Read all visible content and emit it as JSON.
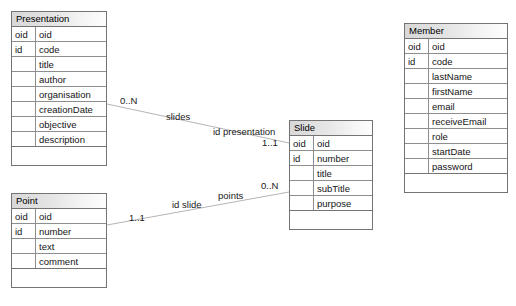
{
  "diagram": {
    "line_color": "#b4b4b4",
    "border_color": "#747474",
    "header_color": "#e0e0e0",
    "background": "#ffffff"
  },
  "classes": [
    {
      "id": "presentation",
      "name": "Presentation",
      "x": 11,
      "y": 11,
      "width": 96,
      "attributes": [
        {
          "key": "oid",
          "name": "oid"
        },
        {
          "key": "id",
          "name": "code"
        },
        {
          "key": "",
          "name": "title"
        },
        {
          "key": "",
          "name": "author"
        },
        {
          "key": "",
          "name": "organisation"
        },
        {
          "key": "",
          "name": "creationDate"
        },
        {
          "key": "",
          "name": "objective"
        },
        {
          "key": "",
          "name": "description"
        }
      ]
    },
    {
      "id": "slide",
      "name": "Slide",
      "x": 289,
      "y": 120,
      "width": 84,
      "attributes": [
        {
          "key": "oid",
          "name": "oid"
        },
        {
          "key": "id",
          "name": "number"
        },
        {
          "key": "",
          "name": "title"
        },
        {
          "key": "",
          "name": "subTitle"
        },
        {
          "key": "",
          "name": "purpose"
        }
      ]
    },
    {
      "id": "member",
      "name": "Member",
      "x": 404,
      "y": 23,
      "width": 104,
      "attributes": [
        {
          "key": "oid",
          "name": "oid"
        },
        {
          "key": "id",
          "name": "code"
        },
        {
          "key": "",
          "name": "lastName"
        },
        {
          "key": "",
          "name": "firstName"
        },
        {
          "key": "",
          "name": "email"
        },
        {
          "key": "",
          "name": "receiveEmail"
        },
        {
          "key": "",
          "name": "role"
        },
        {
          "key": "",
          "name": "startDate"
        },
        {
          "key": "",
          "name": "password"
        }
      ]
    },
    {
      "id": "point",
      "name": "Point",
      "x": 11,
      "y": 193,
      "width": 96,
      "attributes": [
        {
          "key": "oid",
          "name": "oid"
        },
        {
          "key": "id",
          "name": "number"
        },
        {
          "key": "",
          "name": "text"
        },
        {
          "key": "",
          "name": "comment"
        }
      ]
    }
  ],
  "associations": [
    {
      "id": "slides",
      "name": "slides",
      "from": "presentation",
      "to": "slide",
      "x1": 107,
      "y1": 104,
      "x2": 289,
      "y2": 143,
      "name_label": {
        "text": "slides",
        "x": 166,
        "y": 111
      },
      "role_label": {
        "text": "id presentation",
        "x": 213,
        "y": 126
      },
      "source_multiplicity": {
        "text": "0..N",
        "x": 120,
        "y": 95
      },
      "target_multiplicity": {
        "text": "1..1",
        "x": 262,
        "y": 137
      }
    },
    {
      "id": "points",
      "name": "points",
      "from": "point",
      "to": "slide",
      "x1": 107,
      "y1": 225,
      "x2": 289,
      "y2": 192,
      "name_label": {
        "text": "points",
        "x": 218,
        "y": 190
      },
      "role_label": {
        "text": "id slide",
        "x": 172,
        "y": 199
      },
      "source_multiplicity": {
        "text": "1..1",
        "x": 129,
        "y": 212
      },
      "target_multiplicity": {
        "text": "0..N",
        "x": 261,
        "y": 180
      }
    }
  ]
}
